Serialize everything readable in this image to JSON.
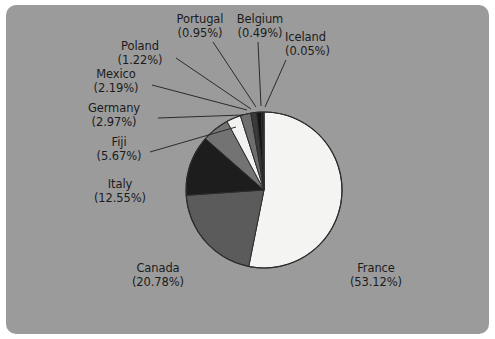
{
  "figure": {
    "panel_background": "#9b9b9b",
    "outer_background": "#ffffff",
    "label_color": "#1b1b1b",
    "leader_color": "#2b2b2b"
  },
  "chart_data": {
    "type": "pie",
    "title": "",
    "subtitle": "",
    "xlabel": "",
    "ylabel": "",
    "grid": false,
    "legend_position": "none",
    "label_format": "name (percent%)",
    "start_angle_deg": 0,
    "direction": "clockwise",
    "categories": [
      "France",
      "Canada",
      "Italy",
      "Fiji",
      "Germany",
      "Mexico",
      "Poland",
      "Portugal",
      "Belgium",
      "Iceland"
    ],
    "values": [
      53.12,
      20.78,
      12.55,
      5.67,
      2.97,
      2.19,
      1.22,
      0.95,
      0.49,
      0.05
    ],
    "value_unit": "%",
    "colors": [
      "#f4f4f2",
      "#5b5b5b",
      "#1d1d1d",
      "#737373",
      "#f2f2f0",
      "#6e6e6e",
      "#3a3a3a",
      "#141414",
      "#202020",
      "#8c8c8c"
    ],
    "slices": [
      {
        "name": "France",
        "percent": 53.12,
        "label": "France",
        "percent_label": "(53.12%)",
        "color": "#f4f4f2"
      },
      {
        "name": "Canada",
        "percent": 20.78,
        "label": "Canada",
        "percent_label": "(20.78%)",
        "color": "#5b5b5b"
      },
      {
        "name": "Italy",
        "percent": 12.55,
        "label": "Italy",
        "percent_label": "(12.55%)",
        "color": "#1d1d1d"
      },
      {
        "name": "Fiji",
        "percent": 5.67,
        "label": "Fiji",
        "percent_label": "(5.67%)",
        "color": "#737373"
      },
      {
        "name": "Germany",
        "percent": 2.97,
        "label": "Germany",
        "percent_label": "(2.97%)",
        "color": "#f2f2f0"
      },
      {
        "name": "Mexico",
        "percent": 2.19,
        "label": "Mexico",
        "percent_label": "(2.19%)",
        "color": "#6e6e6e"
      },
      {
        "name": "Poland",
        "percent": 1.22,
        "label": "Poland",
        "percent_label": "(1.22%)",
        "color": "#3a3a3a"
      },
      {
        "name": "Portugal",
        "percent": 0.95,
        "label": "Portugal",
        "percent_label": "(0.95%)",
        "color": "#141414"
      },
      {
        "name": "Belgium",
        "percent": 0.49,
        "label": "Belgium",
        "percent_label": "(0.49%)",
        "color": "#202020"
      },
      {
        "name": "Iceland",
        "percent": 0.05,
        "label": "Iceland",
        "percent_label": "(0.05%)",
        "color": "#8c8c8c"
      }
    ]
  },
  "labels": {
    "portugal": {
      "name": "Portugal",
      "percent": "(0.95%)"
    },
    "belgium": {
      "name": "Belgium",
      "percent": "(0.49%)"
    },
    "iceland": {
      "name": "Iceland",
      "percent": "(0.05%)"
    },
    "poland": {
      "name": "Poland",
      "percent": "(1.22%)"
    },
    "mexico": {
      "name": "Mexico",
      "percent": "(2.19%)"
    },
    "germany": {
      "name": "Germany",
      "percent": "(2.97%)"
    },
    "fiji": {
      "name": "Fiji",
      "percent": "(5.67%)"
    },
    "italy": {
      "name": "Italy",
      "percent": "(12.55%)"
    },
    "canada": {
      "name": "Canada",
      "percent": "(20.78%)"
    },
    "france": {
      "name": "France",
      "percent": "(53.12%)"
    }
  }
}
